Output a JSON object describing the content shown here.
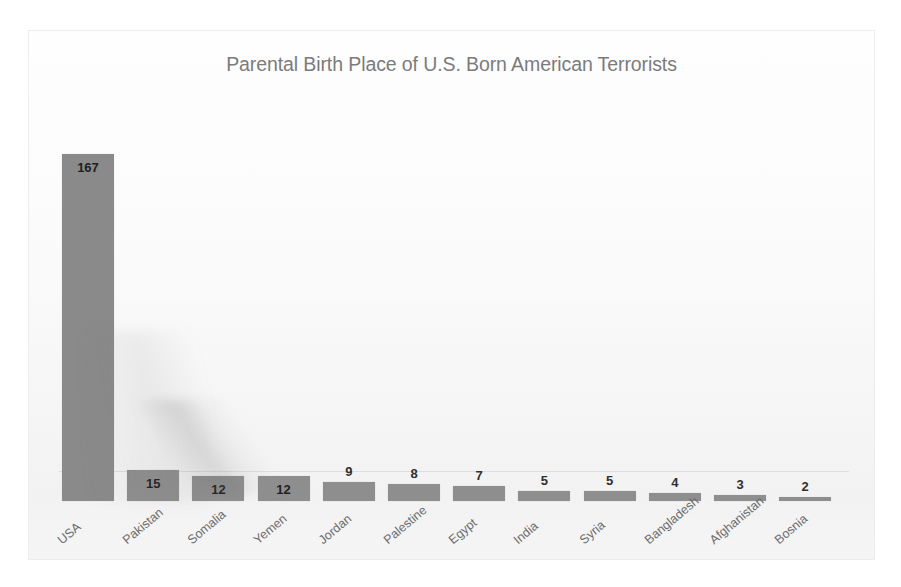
{
  "chart_data": {
    "type": "bar",
    "title": "Parental Birth Place of U.S. Born American Terrorists",
    "xlabel": "",
    "ylabel": "",
    "ylim": [
      0,
      180
    ],
    "grid": false,
    "legend": false,
    "axis_line_color": "#dedede",
    "bar_color": "#8e8e8e",
    "title_color": "#7b7b7b",
    "label_color": "#6c6c6c",
    "value_label_color": "#2f2f2f",
    "categories": [
      "USA",
      "Pakistan",
      "Somalia",
      "Yemen",
      "Jordan",
      "Palestine",
      "Egypt",
      "India",
      "Syria",
      "Bangladesh",
      "Afghanistan",
      "Bosnia"
    ],
    "values": [
      167,
      15,
      12,
      12,
      9,
      8,
      7,
      5,
      5,
      4,
      3,
      2
    ],
    "value_labels": [
      "167",
      "15",
      "12",
      "12",
      "9",
      "8",
      "7",
      "5",
      "5",
      "4",
      "3",
      "2"
    ],
    "label_placement": [
      "inside",
      "inside",
      "inside",
      "inside",
      "above",
      "above",
      "above",
      "above",
      "above",
      "above",
      "above",
      "above"
    ]
  }
}
